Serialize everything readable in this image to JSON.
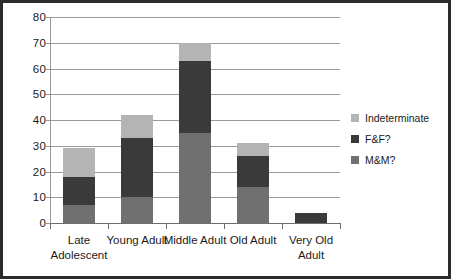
{
  "chart_data": {
    "type": "bar",
    "subtype": "stacked-bar",
    "title": "",
    "xlabel": "",
    "ylabel": "",
    "ylim": [
      0,
      80
    ],
    "yticks": [
      0,
      10,
      20,
      30,
      40,
      50,
      60,
      70,
      80
    ],
    "grid": true,
    "legend_position": "right",
    "categories": [
      "Late Adolescent",
      "Young Adult",
      "Middle Adult",
      "Old Adult",
      "Very Old Adult"
    ],
    "series": [
      {
        "name": "M&M?",
        "values": [
          7,
          10,
          35,
          14,
          0
        ],
        "color": "#707070"
      },
      {
        "name": "F&F?",
        "values": [
          11,
          23,
          28,
          12,
          4
        ],
        "color": "#3a3a3a"
      },
      {
        "name": "Indeterminate",
        "values": [
          11,
          9,
          7,
          5,
          0
        ],
        "color": "#b4b4b4"
      }
    ],
    "totals": [
      29,
      42,
      70,
      31,
      4
    ]
  },
  "legend": {
    "items": [
      {
        "label": "Indeterminate",
        "color": "#b4b4b4"
      },
      {
        "label": "F&F?",
        "color": "#3a3a3a"
      },
      {
        "label": "M&M?",
        "color": "#707070"
      }
    ]
  },
  "axis": {
    "y_tick_labels": [
      "80",
      "70",
      "60",
      "50",
      "40",
      "30",
      "20",
      "10",
      "0"
    ],
    "x_tick_labels": [
      "Late Adolescent",
      "Young Adult",
      "Middle Adult",
      "Old Adult",
      "Very Old Adult"
    ]
  },
  "colors": {
    "frame": "#2b2b2b",
    "gridline": "#9a9a9a",
    "axis": "#6e6e6e",
    "background": "#ffffff",
    "text": "#1a1a1a"
  }
}
